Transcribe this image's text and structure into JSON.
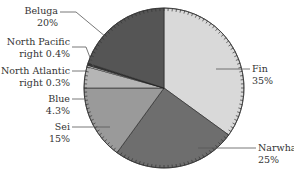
{
  "chart_data": {
    "type": "pie",
    "title": "",
    "start_angle_deg": 0,
    "direction": "clockwise",
    "slices": [
      {
        "label": "Fin",
        "value": 35,
        "display": "35%",
        "color": "#d9d9d9"
      },
      {
        "label": "Narwhal",
        "value": 25,
        "display": "25%",
        "color": "#6e6e6e"
      },
      {
        "label": "Sei",
        "value": 15,
        "display": "15%",
        "color": "#9a9a9a"
      },
      {
        "label": "Blue",
        "value": 4.3,
        "display": "4.3%",
        "color": "#b5b5b5"
      },
      {
        "label": "North Atlantic right",
        "value": 0.3,
        "display": "0.3%",
        "color": "#e8e8e8"
      },
      {
        "label": "North Pacific right",
        "value": 0.4,
        "display": "0.4%",
        "color": "#3a3a3a"
      },
      {
        "label": "Beluga",
        "value": 20,
        "display": "20%",
        "color": "#555555"
      }
    ]
  },
  "labels": {
    "beluga": {
      "name": "Beluga",
      "pct": "20%"
    },
    "north_pacific": {
      "name": "North Pacific",
      "pct": "right 0.4%"
    },
    "north_atlantic": {
      "name": "North Atlantic",
      "pct": "right 0.3%"
    },
    "blue": {
      "name": "Blue",
      "pct": "4.3%"
    },
    "sei": {
      "name": "Sei",
      "pct": "15%"
    },
    "fin": {
      "name": "Fin",
      "pct": "35%"
    },
    "narwhal": {
      "name": "Narwhal",
      "pct": "25%"
    }
  }
}
